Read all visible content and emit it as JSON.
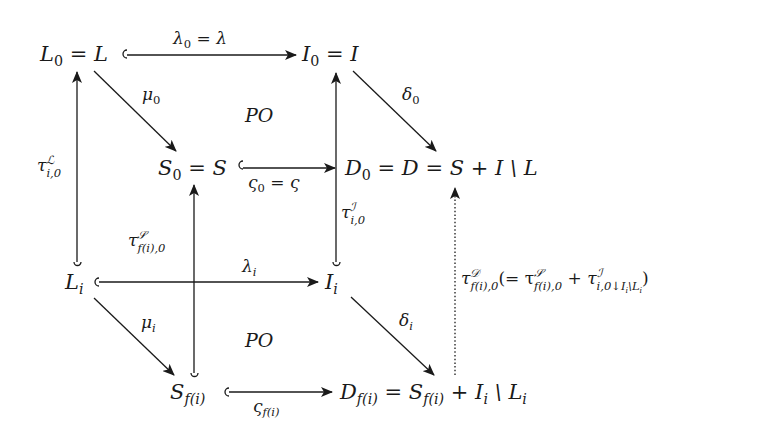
{
  "diagram": {
    "type": "commutative-diagram",
    "nodes": {
      "L0": {
        "main": "L",
        "sub": "0",
        "rest": " = L"
      },
      "I0": {
        "main": "I",
        "sub": "0",
        "rest": " = I"
      },
      "S0": {
        "main": "S",
        "sub": "0",
        "rest": " = S"
      },
      "D0": {
        "main": "D",
        "sub": "0",
        "rest": " = D = S + I \\ L"
      },
      "Li": {
        "main": "L",
        "sub": "i"
      },
      "Ii": {
        "main": "I",
        "sub": "i"
      },
      "Sfi": {
        "main": "S",
        "sub": "f(i)"
      },
      "Dfi": {
        "main": "D",
        "sub": "f(i)",
        "rest1": " = S",
        "rest1_sub": "f(i)",
        "rest2": " + I",
        "rest2_sub": "i",
        "rest3": " \\ L",
        "rest3_sub": "i"
      }
    },
    "arrows": {
      "lambda0": {
        "from": "L0",
        "to": "I0",
        "style": "hook",
        "label_main": "λ",
        "label_sub": "0",
        "label_rest": " = λ"
      },
      "mu0": {
        "from": "L0",
        "to": "S0",
        "style": "solid",
        "label_main": "μ",
        "label_sub": "0"
      },
      "delta0": {
        "from": "I0",
        "to": "D0",
        "style": "solid",
        "label_main": "δ",
        "label_sub": "0"
      },
      "varsigma0": {
        "from": "S0",
        "to": "D0",
        "style": "hook",
        "label_main": "ς",
        "label_sub": "0",
        "label_rest": " = ς"
      },
      "lambdai": {
        "from": "Li",
        "to": "Ii",
        "style": "hook",
        "label_main": "λ",
        "label_sub": "i"
      },
      "mui": {
        "from": "Li",
        "to": "Sfi",
        "style": "solid",
        "label_main": "μ",
        "label_sub": "i"
      },
      "deltai": {
        "from": "Ii",
        "to": "Dfi",
        "style": "solid",
        "label_main": "δ",
        "label_sub": "i"
      },
      "varsigmafi": {
        "from": "Sfi",
        "to": "Dfi",
        "style": "hook",
        "label_main": "ς",
        "label_sub": "f(i)"
      },
      "tauL": {
        "from": "Li",
        "to": "L0",
        "style": "hook",
        "label_main": "τ",
        "label_sup": "ℒ",
        "label_sub": "i,0"
      },
      "tauS": {
        "from": "Sfi",
        "to": "S0",
        "style": "hook",
        "label_main": "τ",
        "label_sup": "𝒮",
        "label_sub": "f(i),0"
      },
      "tauI": {
        "from": "Ii",
        "to": "I0",
        "style": "hook",
        "label_main": "τ",
        "label_sup": "ℐ",
        "label_sub": "i,0"
      },
      "tauD": {
        "from": "Dfi",
        "to": "D0",
        "style": "dotted",
        "label_main": "τ",
        "label_sup": "𝒟",
        "label_sub": "f(i),0",
        "paren_open": "(= τ",
        "part2_sup": "𝒮",
        "part2_sub": "f(i),0",
        "plus": " + τ",
        "part3_sup": "ℐ",
        "part3_sub": "i,0↓I",
        "part3_sub_i": "i",
        "part3_sub_rest": "\\L",
        "part3_sub_rest_i": "i",
        "paren_close": ")"
      }
    },
    "annotations": {
      "po_top": "PO",
      "po_bottom": "PO"
    }
  }
}
